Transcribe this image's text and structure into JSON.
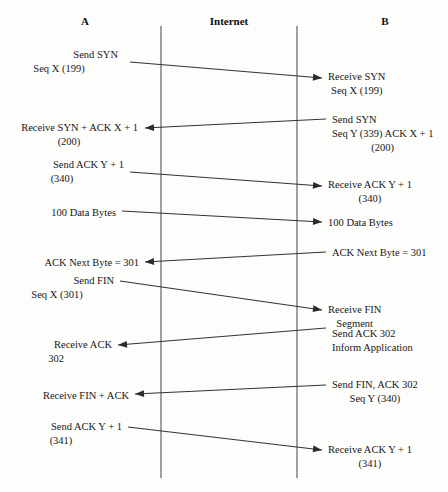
{
  "diagram": {
    "type": "sequence-diagram",
    "canvas": {
      "width": 448,
      "height": 492,
      "background": "#fdfdfc"
    },
    "stroke_color": "#333333",
    "lifeline_color": "#5d5d5d",
    "text_color": "#171717"
  },
  "columns": [
    {
      "id": "host-a",
      "label": "A",
      "x": 85,
      "y": 16
    },
    {
      "id": "internet",
      "label": "Internet",
      "x": 229,
      "y": 16
    },
    {
      "id": "host-b",
      "label": "B",
      "x": 385,
      "y": 16
    }
  ],
  "lifelines": [
    {
      "id": "lifeline-left",
      "x": 161,
      "y1": 26,
      "y2": 478
    },
    {
      "id": "lifeline-right",
      "x": 297,
      "y1": 26,
      "y2": 478
    }
  ],
  "messages": [
    {
      "id": "msg-send-syn",
      "direction": "a-to-b",
      "x1": 130,
      "y1": 62,
      "x2": 322,
      "y2": 78,
      "source_lines": [
        "Send SYN",
        "Seq X (199)"
      ],
      "source_x": 118,
      "source_y": 48,
      "source_align": "right",
      "target_lines": [
        "Receive SYN",
        "Seq X (199)"
      ],
      "target_x": 328,
      "target_y": 70,
      "target_align": "left"
    },
    {
      "id": "msg-send-syn-ack",
      "direction": "b-to-a",
      "x1": 326,
      "y1": 119,
      "x2": 145,
      "y2": 128,
      "source_lines": [
        "Send SYN",
        "Seq Y (339) ACK X + 1",
        "(200)"
      ],
      "source_x": 332,
      "source_y": 113,
      "source_align": "left",
      "target_lines": [
        "Receive SYN + ACK X + 1",
        "(200)"
      ],
      "target_x": 138,
      "target_y": 121,
      "target_align": "right"
    },
    {
      "id": "msg-send-ack-y1",
      "direction": "a-to-b",
      "x1": 130,
      "y1": 172,
      "x2": 322,
      "y2": 186,
      "source_lines": [
        "Send ACK Y + 1",
        "(340)"
      ],
      "source_x": 124,
      "source_y": 158,
      "source_align": "right",
      "target_lines": [
        "Receive ACK Y + 1",
        "(340)"
      ],
      "target_x": 328,
      "target_y": 178,
      "target_align": "left"
    },
    {
      "id": "msg-100-data-bytes",
      "direction": "a-to-b",
      "x1": 122,
      "y1": 211,
      "x2": 322,
      "y2": 222,
      "source_lines": [
        "100 Data Bytes"
      ],
      "source_x": 116,
      "source_y": 206,
      "source_align": "right",
      "target_lines": [
        "100 Data Bytes"
      ],
      "target_x": 328,
      "target_y": 216,
      "target_align": "left"
    },
    {
      "id": "msg-ack-next-byte",
      "direction": "b-to-a",
      "x1": 326,
      "y1": 252,
      "x2": 145,
      "y2": 262,
      "source_lines": [
        "ACK Next Byte = 301"
      ],
      "source_x": 332,
      "source_y": 246,
      "source_align": "left",
      "target_lines": [
        "ACK Next Byte = 301"
      ],
      "target_x": 139,
      "target_y": 256,
      "target_align": "right"
    },
    {
      "id": "msg-send-fin",
      "direction": "a-to-b",
      "x1": 120,
      "y1": 281,
      "x2": 322,
      "y2": 310,
      "source_lines": [
        "Send FIN",
        "Seq X (301)"
      ],
      "source_x": 114,
      "source_y": 274,
      "source_align": "right",
      "target_lines": [
        "Receive FIN",
        "Segment"
      ],
      "target_x": 328,
      "target_y": 303,
      "target_align": "left"
    },
    {
      "id": "msg-send-ack-302",
      "direction": "b-to-a",
      "x1": 326,
      "y1": 328,
      "x2": 118,
      "y2": 345,
      "source_lines": [
        "Send ACK 302",
        "Inform Application"
      ],
      "source_x": 332,
      "source_y": 327,
      "source_align": "left",
      "target_lines": [
        "Receive ACK",
        "302"
      ],
      "target_x": 112,
      "target_y": 338,
      "target_align": "right"
    },
    {
      "id": "msg-send-fin-ack",
      "direction": "b-to-a",
      "x1": 326,
      "y1": 385,
      "x2": 135,
      "y2": 394,
      "source_lines": [
        "Send FIN, ACK 302",
        "Seq Y (340)"
      ],
      "source_x": 332,
      "source_y": 378,
      "source_align": "left",
      "target_lines": [
        "Receive FIN + ACK"
      ],
      "target_x": 129,
      "target_y": 389,
      "target_align": "right"
    },
    {
      "id": "msg-send-ack-y1-final",
      "direction": "a-to-b",
      "x1": 128,
      "y1": 427,
      "x2": 322,
      "y2": 450,
      "source_lines": [
        "Send ACK Y + 1",
        "(341)"
      ],
      "source_x": 122,
      "source_y": 420,
      "source_align": "right",
      "target_lines": [
        "Receive ACK Y + 1",
        "(341)"
      ],
      "target_x": 328,
      "target_y": 443,
      "target_align": "left"
    }
  ]
}
